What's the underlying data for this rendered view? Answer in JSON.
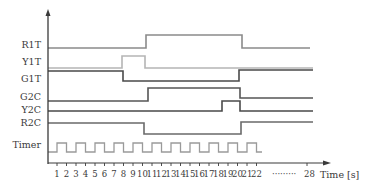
{
  "diagram": {
    "type": "timing",
    "x_axis_label": "Time [s]",
    "tick_labels": [
      "1",
      "2",
      "3",
      "4",
      "5",
      "6",
      "7",
      "8",
      "9",
      "10",
      "11",
      "12",
      "13",
      "14",
      "15",
      "16",
      "17",
      "18",
      "19",
      "20",
      "21",
      "22"
    ],
    "ellipsis": "·········",
    "end_tick_label": "28",
    "signals": [
      {
        "name": "R1T",
        "color": "#8a8a8a",
        "label_y": 48,
        "points": [
          [
            48,
            48
          ],
          [
            146,
            48
          ],
          [
            146,
            35
          ],
          [
            242,
            35
          ],
          [
            242,
            48
          ],
          [
            310,
            48
          ]
        ]
      },
      {
        "name": "Y1T",
        "color": "#b5b5b5",
        "label_y": 65,
        "points": [
          [
            48,
            68
          ],
          [
            122,
            68
          ],
          [
            122,
            56
          ],
          [
            145,
            56
          ],
          [
            145,
            68
          ],
          [
            313,
            68
          ]
        ]
      },
      {
        "name": "G1T",
        "color": "#4a4a4a",
        "label_y": 82,
        "points": [
          [
            48,
            71
          ],
          [
            123,
            71
          ],
          [
            123,
            81
          ],
          [
            239,
            81
          ],
          [
            239,
            70
          ],
          [
            313,
            70
          ]
        ]
      },
      {
        "name": "G2C",
        "color": "#555555",
        "label_y": 100,
        "points": [
          [
            48,
            101
          ],
          [
            148,
            101
          ],
          [
            148,
            88
          ],
          [
            240,
            88
          ],
          [
            240,
            98
          ],
          [
            313,
            98
          ]
        ]
      },
      {
        "name": "Y2C",
        "color": "#4a4a4a",
        "label_y": 113,
        "points": [
          [
            48,
            111
          ],
          [
            222,
            111
          ],
          [
            222,
            101
          ],
          [
            240,
            101
          ],
          [
            240,
            111
          ],
          [
            313,
            111
          ]
        ]
      },
      {
        "name": "R2C",
        "color": "#6a6a6a",
        "label_y": 126,
        "points": [
          [
            48,
            123
          ],
          [
            144,
            123
          ],
          [
            144,
            134
          ],
          [
            241,
            134
          ],
          [
            241,
            122
          ],
          [
            313,
            122
          ]
        ]
      }
    ],
    "timer": {
      "name": "Timer",
      "color": "#9a9a9a",
      "label_y": 148,
      "start_x": 48,
      "first_rise_x": 57,
      "half_period": 9.5,
      "low_y": 152,
      "high_y": 143,
      "end_x": 262,
      "cycles": 11
    },
    "colors": {
      "axis": "#3a3a3a",
      "text": "#3a3a3a",
      "background": "#ffffff"
    }
  }
}
